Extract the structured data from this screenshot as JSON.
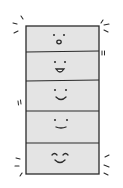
{
  "illustration": {
    "subject": "stack of five smiling boxes",
    "colors": {
      "background": "#ffffff",
      "box_fill": "#e4e4e4",
      "outline": "#2a2a2a"
    },
    "boxes": [
      {
        "index": 0,
        "expression": "surprised"
      },
      {
        "index": 1,
        "expression": "open-smile"
      },
      {
        "index": 2,
        "expression": "smile"
      },
      {
        "index": 3,
        "expression": "small-smile"
      },
      {
        "index": 4,
        "expression": "happy-closed-eyes"
      }
    ]
  }
}
